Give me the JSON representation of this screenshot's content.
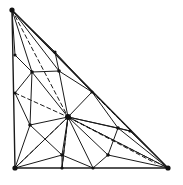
{
  "figure": {
    "name": "triangulated-right-triangle-mesh",
    "width": 183,
    "height": 185,
    "background_color": "#ffffff",
    "line_color": "#1a1a1a",
    "dashed_color": "#1a1a1a"
  },
  "geometry": {
    "outline_label": "right triangle outline",
    "corners": {
      "apex": [
        12,
        10
      ],
      "bottom_left": [
        15,
        168
      ],
      "bottom_right": [
        168,
        168
      ]
    },
    "vertices": [
      {
        "id": "A",
        "name": "apex-corner",
        "x": 12,
        "y": 10,
        "marked": true
      },
      {
        "id": "B",
        "name": "bottom-left-corner",
        "x": 15,
        "y": 168,
        "marked": true
      },
      {
        "id": "C",
        "name": "bottom-right-corner",
        "x": 168,
        "y": 168,
        "marked": true
      },
      {
        "id": "L1",
        "name": "left-edge-upper",
        "x": 15,
        "y": 55,
        "marked": true
      },
      {
        "id": "L2",
        "name": "left-edge-lower",
        "x": 15,
        "y": 93,
        "marked": true
      },
      {
        "id": "H1",
        "name": "hypotenuse-upper",
        "x": 55,
        "y": 52,
        "marked": true
      },
      {
        "id": "H2",
        "name": "hypotenuse-mid",
        "x": 92,
        "y": 92,
        "marked": true
      },
      {
        "id": "H3",
        "name": "hypotenuse-lower",
        "x": 130,
        "y": 131,
        "marked": true
      },
      {
        "id": "B1",
        "name": "bottom-edge-mid",
        "x": 62,
        "y": 168,
        "marked": true
      },
      {
        "id": "B2",
        "name": "bottom-edge-right",
        "x": 93,
        "y": 168,
        "marked": true
      },
      {
        "id": "V1",
        "name": "interior-upper-left",
        "x": 32,
        "y": 72,
        "marked": true
      },
      {
        "id": "V2",
        "name": "interior-upper-right",
        "x": 59,
        "y": 71,
        "marked": true
      },
      {
        "id": "HUB",
        "name": "central-hub",
        "x": 68,
        "y": 117,
        "marked": true
      },
      {
        "id": "V3",
        "name": "interior-left-low",
        "x": 30,
        "y": 125,
        "marked": true
      },
      {
        "id": "V4",
        "name": "interior-lower-mid",
        "x": 62,
        "y": 155,
        "marked": true
      },
      {
        "id": "V5",
        "name": "interior-right-low",
        "x": 118,
        "y": 128,
        "marked": true
      },
      {
        "id": "V6",
        "name": "interior-lower-right",
        "x": 108,
        "y": 155,
        "marked": true
      }
    ],
    "solid_edges": [
      [
        "A",
        "L1"
      ],
      [
        "L1",
        "L2"
      ],
      [
        "L2",
        "B"
      ],
      [
        "B",
        "B1"
      ],
      [
        "B1",
        "B2"
      ],
      [
        "B2",
        "C"
      ],
      [
        "A",
        "H1"
      ],
      [
        "H1",
        "H2"
      ],
      [
        "H2",
        "H3"
      ],
      [
        "H3",
        "C"
      ],
      [
        "A",
        "V1"
      ],
      [
        "A",
        "V2"
      ],
      [
        "A",
        "H2"
      ],
      [
        "L1",
        "V1"
      ],
      [
        "L2",
        "V1"
      ],
      [
        "L2",
        "V3"
      ],
      [
        "V1",
        "V2"
      ],
      [
        "V1",
        "HUB"
      ],
      [
        "V2",
        "H1"
      ],
      [
        "V2",
        "H2"
      ],
      [
        "V2",
        "HUB"
      ],
      [
        "H1",
        "V2"
      ],
      [
        "H2",
        "HUB"
      ],
      [
        "H2",
        "V5"
      ],
      [
        "H3",
        "V5"
      ],
      [
        "H3",
        "HUB"
      ],
      [
        "HUB",
        "V3"
      ],
      [
        "HUB",
        "V4"
      ],
      [
        "HUB",
        "B1"
      ],
      [
        "HUB",
        "B2"
      ],
      [
        "HUB",
        "V5"
      ],
      [
        "HUB",
        "V6"
      ],
      [
        "HUB",
        "C"
      ],
      [
        "HUB",
        "B"
      ],
      [
        "V3",
        "B"
      ],
      [
        "V3",
        "V4"
      ],
      [
        "V3",
        "B1"
      ],
      [
        "V4",
        "B1"
      ],
      [
        "V4",
        "B2"
      ],
      [
        "V4",
        "B"
      ],
      [
        "V5",
        "V6"
      ],
      [
        "V5",
        "C"
      ],
      [
        "V6",
        "B2"
      ],
      [
        "V6",
        "C"
      ],
      [
        "B2",
        "C"
      ],
      [
        "V3",
        "L2"
      ],
      [
        "V1",
        "L1"
      ]
    ],
    "dashed_edges": [
      [
        "A",
        "HUB"
      ],
      [
        "L2",
        "HUB"
      ],
      [
        "B",
        "HUB"
      ],
      [
        "HUB",
        "C"
      ],
      [
        "V5",
        "C"
      ],
      [
        "B1",
        "HUB"
      ],
      [
        "A",
        "V2"
      ],
      [
        "H2",
        "C"
      ]
    ],
    "counts": {
      "vertices": 17,
      "solid_edges": 47,
      "dashed_edges": 8
    }
  }
}
